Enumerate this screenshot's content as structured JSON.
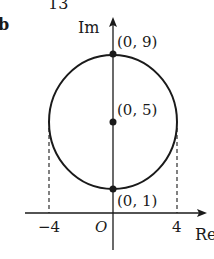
{
  "page": {
    "number_fragment": "13",
    "corner_fragment": "b"
  },
  "axes": {
    "imag_label": "Im",
    "real_label": "Re",
    "origin_label": "O"
  },
  "ticks": {
    "neg4": "−4",
    "pos4": "4"
  },
  "points": {
    "top": "(0, 9)",
    "center": "(0, 5)",
    "bottom": "(0, 1)"
  },
  "colors": {
    "ink": "#1a1a1a",
    "background": "#ffffff"
  }
}
